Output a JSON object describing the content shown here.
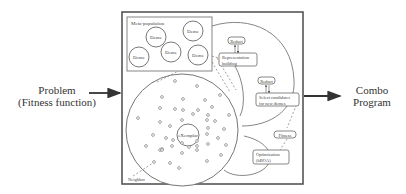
{
  "diagram": {
    "input": {
      "line1": "Problem",
      "line2": "(Fitness function)"
    },
    "output": {
      "line1": "Combo",
      "line2": "Program"
    },
    "metapopulation": {
      "title": "Meta-population",
      "demes": [
        "Deme",
        "Deme",
        "Deme",
        "Deme",
        "Deme"
      ]
    },
    "center": "eXemplar",
    "neighbor_label": "Neighbor",
    "steps": {
      "reduct1": "Reduct",
      "representation": {
        "line1": "Representation",
        "line2": "building"
      },
      "reduct2": "Reduct",
      "select": {
        "line1": "Select candidates",
        "line2": "for new demes"
      },
      "fitness": "Fitness",
      "optimization": {
        "line1": "Optimization",
        "line2": "(hBOA)"
      }
    }
  }
}
